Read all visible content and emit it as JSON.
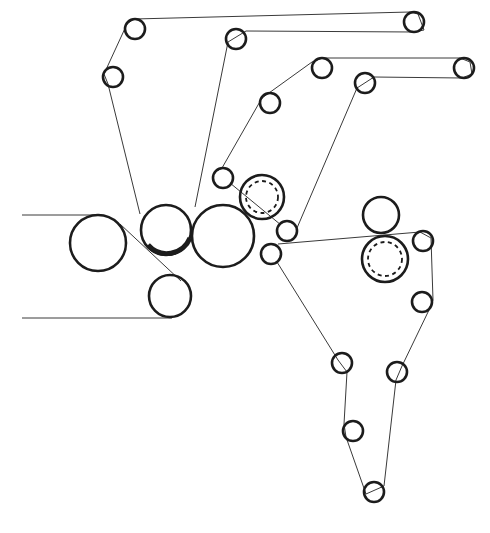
{
  "diagram": {
    "type": "press-section-felt-run",
    "colors": {
      "line": "#1c1c1c",
      "background": "#ffffff"
    },
    "rolls": [
      {
        "id": "large-left-roll",
        "cx": 98,
        "cy": 243,
        "r": 28
      },
      {
        "id": "center-press-roll",
        "cx": 166,
        "cy": 230,
        "r": 25
      },
      {
        "id": "lower-press-roll",
        "cx": 170,
        "cy": 296,
        "r": 21
      },
      {
        "id": "large-right-roll",
        "cx": 223,
        "cy": 236,
        "r": 31
      },
      {
        "id": "upper-nip-roll",
        "cx": 381,
        "cy": 215,
        "r": 18
      },
      {
        "id": "guide-roll-1",
        "cx": 135,
        "cy": 29,
        "r": 10
      },
      {
        "id": "guide-roll-2",
        "cx": 113,
        "cy": 77,
        "r": 10
      },
      {
        "id": "guide-roll-3",
        "cx": 236,
        "cy": 39,
        "r": 10
      },
      {
        "id": "guide-roll-4",
        "cx": 414,
        "cy": 22,
        "r": 10
      },
      {
        "id": "guide-roll-5",
        "cx": 322,
        "cy": 68,
        "r": 10
      },
      {
        "id": "guide-roll-6",
        "cx": 464,
        "cy": 68,
        "r": 10
      },
      {
        "id": "guide-roll-7",
        "cx": 270,
        "cy": 103,
        "r": 10
      },
      {
        "id": "guide-roll-8",
        "cx": 365,
        "cy": 83,
        "r": 10
      },
      {
        "id": "guide-roll-9",
        "cx": 223,
        "cy": 178,
        "r": 10
      },
      {
        "id": "guide-roll-10",
        "cx": 287,
        "cy": 231,
        "r": 10
      },
      {
        "id": "guide-roll-11",
        "cx": 271,
        "cy": 254,
        "r": 10
      },
      {
        "id": "guide-roll-12",
        "cx": 423,
        "cy": 241,
        "r": 10
      },
      {
        "id": "guide-roll-13",
        "cx": 422,
        "cy": 302,
        "r": 10
      },
      {
        "id": "guide-roll-14",
        "cx": 342,
        "cy": 363,
        "r": 10
      },
      {
        "id": "guide-roll-15",
        "cx": 397,
        "cy": 372,
        "r": 10
      },
      {
        "id": "guide-roll-16",
        "cx": 353,
        "cy": 431,
        "r": 10
      },
      {
        "id": "guide-roll-17",
        "cx": 374,
        "cy": 492,
        "r": 10
      }
    ],
    "heated_rolls": [
      {
        "id": "dashed-roll-upper",
        "cx": 262,
        "cy": 197,
        "r": 22,
        "inner_r": 16
      },
      {
        "id": "dashed-roll-lower",
        "cx": 385,
        "cy": 259,
        "r": 23,
        "inner_r": 17
      }
    ],
    "felt_runs": [
      {
        "id": "top-felt-loop",
        "points": "140,213 108,80 127,23 140,20 414,13 419,32 246,30 236,30 195,207"
      },
      {
        "id": "upper-felt-loop",
        "points": "212,180 228,170 262,96 315,60 464,59 456,77 372,78 360,83 297,226"
      },
      {
        "id": "middle-felt-run",
        "points": "255,246 425,233 432,241 433,300 415,314 400,370 390,382 382,480 371,488 345,440 349,372 276,262"
      }
    ],
    "entry_lines": [
      {
        "id": "upper-entry-line",
        "x1": 22,
        "y1": 215,
        "x2": 98,
        "y2": 215
      },
      {
        "id": "lower-entry-line",
        "x1": 22,
        "y1": 318,
        "x2": 172,
        "y2": 318
      },
      {
        "id": "sheet-transfer-line",
        "x1": 120,
        "y1": 226,
        "x2": 180,
        "y2": 280
      }
    ]
  }
}
